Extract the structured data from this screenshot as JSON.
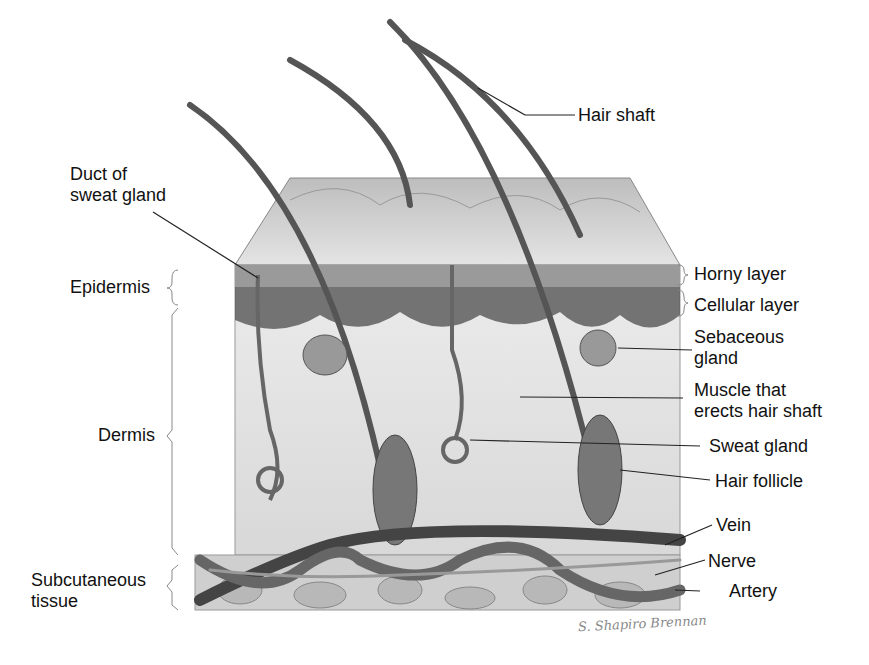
{
  "diagram": {
    "labels": {
      "hair_shaft": "Hair shaft",
      "duct_sweat_gland": [
        "Duct of",
        "sweat gland"
      ],
      "epidermis": "Epidermis",
      "horny_layer": "Horny layer",
      "cellular_layer": "Cellular layer",
      "sebaceous_gland": [
        "Sebaceous",
        "gland"
      ],
      "muscle": [
        "Muscle that",
        "erects hair shaft"
      ],
      "dermis": "Dermis",
      "sweat_gland": "Sweat gland",
      "hair_follicle": "Hair follicle",
      "vein": "Vein",
      "nerve": "Nerve",
      "artery": "Artery",
      "subcutaneous": [
        "Subcutaneous",
        "tissue"
      ]
    },
    "signature": "S. Shapiro Brennan"
  }
}
